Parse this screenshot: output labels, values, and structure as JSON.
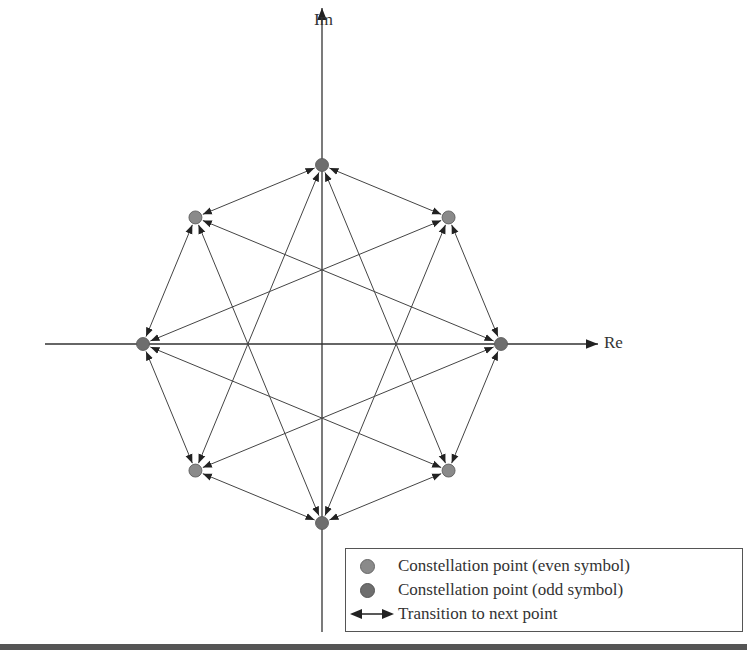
{
  "chart_data": {
    "type": "diagram",
    "title": "",
    "axes": {
      "x_label": "Re",
      "y_label": "Im"
    },
    "constellation": "8-PSK (pi/4-shifted representation)",
    "points": [
      {
        "id": 0,
        "angle_deg": 90,
        "kind": "odd"
      },
      {
        "id": 1,
        "angle_deg": 45,
        "kind": "even"
      },
      {
        "id": 2,
        "angle_deg": 0,
        "kind": "odd"
      },
      {
        "id": 3,
        "angle_deg": -45,
        "kind": "even"
      },
      {
        "id": 4,
        "angle_deg": -90,
        "kind": "odd"
      },
      {
        "id": 5,
        "angle_deg": -135,
        "kind": "even"
      },
      {
        "id": 6,
        "angle_deg": 180,
        "kind": "odd"
      },
      {
        "id": 7,
        "angle_deg": 135,
        "kind": "even"
      }
    ],
    "transitions": "each point connected by bidirectional arrows to neighbors (±1) and to points ±3 positions away",
    "legend": [
      {
        "marker": "circle-light",
        "label": "Constellation point (even symbol)"
      },
      {
        "marker": "circle-dark",
        "label": "Constellation point (odd symbol)"
      },
      {
        "marker": "double-arrow",
        "label": "Transition to next point"
      }
    ]
  },
  "labels": {
    "re": "Re",
    "im": "Im"
  },
  "legend": {
    "even": "Constellation point (even symbol)",
    "odd": "Constellation point (odd symbol)",
    "transition": "Transition to next point"
  },
  "colors": {
    "even": "#8a8a8a",
    "odd": "#6e6e6e",
    "line": "#444444"
  }
}
